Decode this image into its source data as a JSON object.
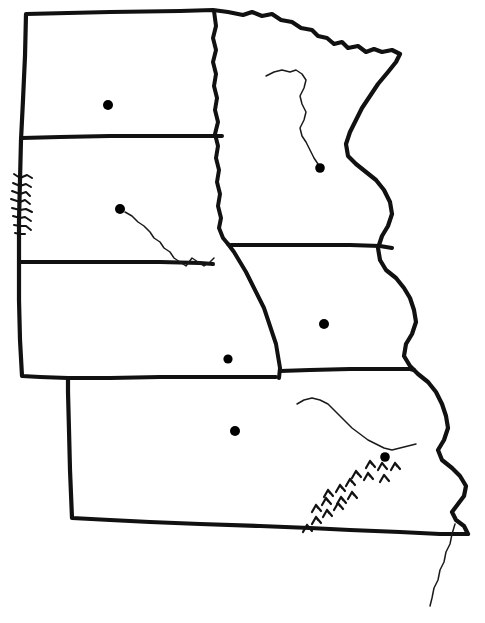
{
  "map": {
    "title": "Outline Map of the Upper Midwest and Great Plains",
    "style": "hand-drawn black-and-white outline map",
    "background_color": "#ffffff",
    "ink_color": "#111111",
    "width": 485,
    "height": 623,
    "states": [
      {
        "name": "North Dakota",
        "label": "",
        "position": "upper-left"
      },
      {
        "name": "South Dakota",
        "label": "",
        "position": "middle-left"
      },
      {
        "name": "Nebraska",
        "label": "",
        "position": "lower-middle-left"
      },
      {
        "name": "Kansas",
        "label": "",
        "position": "bottom-left"
      },
      {
        "name": "Minnesota",
        "label": "",
        "position": "upper-right"
      },
      {
        "name": "Iowa",
        "label": "",
        "position": "middle-right"
      },
      {
        "name": "Missouri",
        "label": "",
        "position": "lower-right"
      }
    ],
    "capitals": [
      {
        "name": "Bismarck",
        "state": "North Dakota",
        "x": 108,
        "y": 105,
        "r": 5.0
      },
      {
        "name": "Pierre",
        "state": "South Dakota",
        "x": 120,
        "y": 209,
        "r": 5.0
      },
      {
        "name": "Lincoln",
        "state": "Nebraska",
        "x": 228,
        "y": 359,
        "r": 4.6
      },
      {
        "name": "Topeka",
        "state": "Kansas",
        "x": 235,
        "y": 431,
        "r": 5.0
      },
      {
        "name": "Saint Paul",
        "state": "Minnesota",
        "x": 320,
        "y": 168,
        "r": 4.8
      },
      {
        "name": "Des Moines",
        "state": "Iowa",
        "x": 324,
        "y": 324,
        "r": 5.0
      },
      {
        "name": "Jefferson City",
        "state": "Missouri",
        "x": 385,
        "y": 457,
        "r": 4.8
      }
    ],
    "rivers": [
      {
        "name": "Missouri River (South Dakota reach)",
        "description": "flows southeast from Pierre toward the southeast corner of South Dakota"
      },
      {
        "name": "Minnesota River",
        "description": "flows southeast then northeast to join the Mississippi at Saint Paul"
      },
      {
        "name": "Missouri River (Missouri reach)",
        "description": "flows east across central Missouri past Jefferson City"
      },
      {
        "name": "Mississippi River (lower reach)",
        "description": "thin line continuing south past the Missouri bootheel"
      }
    ],
    "terrain_symbols": [
      {
        "name": "Black Hills",
        "state": "South Dakota",
        "symbol": "feathered-ridge-hachure",
        "location": "western border of South Dakota"
      },
      {
        "name": "Ozark Plateau",
        "state": "Missouri",
        "symbol": "chevron-hill-marks",
        "count": 17,
        "location": "southern Missouri"
      }
    ],
    "legend": {
      "visible": false,
      "items": []
    },
    "labels": {
      "visible": false,
      "items": []
    }
  }
}
